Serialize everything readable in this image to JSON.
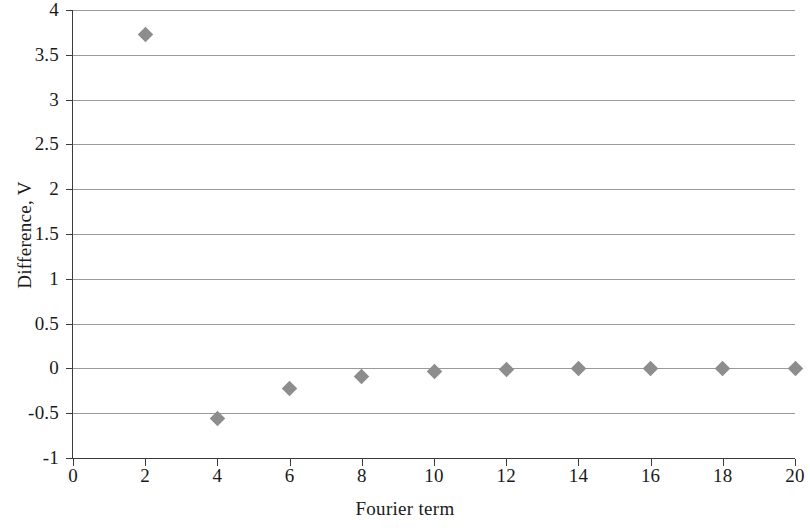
{
  "chart_data": {
    "type": "scatter",
    "title": "",
    "xlabel": "Fourier term",
    "ylabel": "Difference, V",
    "xlim": [
      0,
      20
    ],
    "ylim": [
      -1,
      4
    ],
    "xticks": [
      0,
      2,
      4,
      6,
      8,
      10,
      12,
      14,
      16,
      18,
      20
    ],
    "xtick_labels": [
      "0",
      "2",
      "4",
      "6",
      "8",
      "10",
      "12",
      "14",
      "16",
      "18",
      "20"
    ],
    "yticks": [
      -1,
      -0.5,
      0,
      0.5,
      1,
      1.5,
      2,
      2.5,
      3,
      3.5,
      4
    ],
    "ytick_labels": [
      "-1",
      "-0.5",
      "0",
      "0.5",
      "1",
      "1.5",
      "2",
      "2.5",
      "3",
      "3.5",
      "4"
    ],
    "grid": "horizontal",
    "legend": "none",
    "marker": "diamond",
    "marker_color": "#8d8d8d",
    "x": [
      2,
      4,
      6,
      8,
      10,
      12,
      14,
      16,
      18,
      20
    ],
    "values": [
      3.73,
      -0.56,
      -0.22,
      -0.09,
      -0.04,
      -0.01,
      0.0,
      0.0,
      0.0,
      0.0
    ],
    "points": [
      {
        "x": 2,
        "y": 3.73
      },
      {
        "x": 4,
        "y": -0.56
      },
      {
        "x": 6,
        "y": -0.22
      },
      {
        "x": 8,
        "y": -0.09
      },
      {
        "x": 10,
        "y": -0.04
      },
      {
        "x": 12,
        "y": -0.01
      },
      {
        "x": 14,
        "y": 0.0
      },
      {
        "x": 16,
        "y": 0.0
      },
      {
        "x": 18,
        "y": 0.0
      },
      {
        "x": 20,
        "y": 0.0
      }
    ]
  }
}
